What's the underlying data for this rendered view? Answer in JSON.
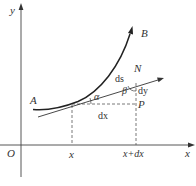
{
  "diagram": {
    "title": "",
    "colors": {
      "axis": "#444444",
      "curve": "#222222",
      "tangent": "#333333",
      "dashed": "#555555",
      "text": "#333333"
    },
    "axes": {
      "y_label": "y",
      "x_label": "x",
      "origin_label": "O"
    },
    "curve": {
      "start_label": "A",
      "end_label": "B"
    },
    "tangent": {
      "end_label": "N"
    },
    "points": {
      "corner_label": "P"
    },
    "segments": {
      "arc_label": "ds",
      "dx_label": "dx",
      "dy_label": "dy"
    },
    "angles": {
      "alpha": "α",
      "beta": "β"
    },
    "x_ticks": {
      "x": "x",
      "x_plus_dx": "x+dx"
    }
  }
}
